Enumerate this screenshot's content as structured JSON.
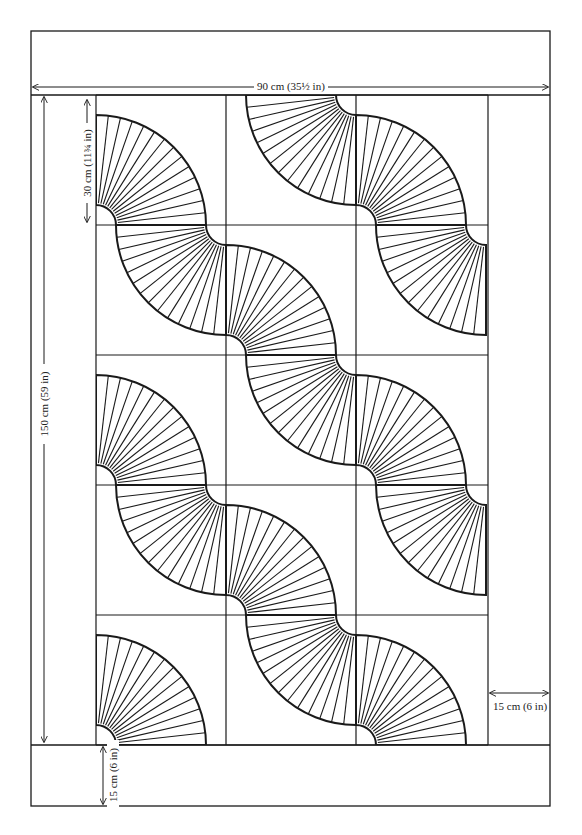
{
  "diagram": {
    "stroke_color": "#1a1a1a",
    "background": "#ffffff",
    "outer_frame": {
      "x": 31,
      "y": 31,
      "w": 519,
      "h": 775
    },
    "inner_panel": {
      "x": 96,
      "y": 95,
      "w": 392,
      "h": 650
    },
    "grid": {
      "columns_x": [
        96,
        226,
        356,
        488
      ],
      "rows_y": [
        95,
        225,
        355,
        485,
        615,
        745
      ]
    },
    "fan": {
      "inner_radius": 20,
      "outer_radius": 110,
      "rays": 14
    },
    "fans": [
      {
        "cx": 96,
        "cy": 225,
        "quadrant": "UR"
      },
      {
        "cx": 226,
        "cy": 225,
        "quadrant": "LL"
      },
      {
        "cx": 226,
        "cy": 355,
        "quadrant": "UR"
      },
      {
        "cx": 356,
        "cy": 355,
        "quadrant": "LL"
      },
      {
        "cx": 356,
        "cy": 485,
        "quadrant": "UR"
      },
      {
        "cx": 486,
        "cy": 485,
        "quadrant": "LL"
      },
      {
        "cx": 356,
        "cy": 95,
        "quadrant": "LL"
      },
      {
        "cx": 356,
        "cy": 225,
        "quadrant": "UR"
      },
      {
        "cx": 486,
        "cy": 225,
        "quadrant": "LL"
      },
      {
        "cx": 96,
        "cy": 485,
        "quadrant": "UR"
      },
      {
        "cx": 226,
        "cy": 485,
        "quadrant": "LL"
      },
      {
        "cx": 226,
        "cy": 615,
        "quadrant": "UR"
      },
      {
        "cx": 356,
        "cy": 615,
        "quadrant": "LL"
      },
      {
        "cx": 356,
        "cy": 745,
        "quadrant": "UR"
      },
      {
        "cx": 96,
        "cy": 745,
        "quadrant": "UR"
      }
    ]
  },
  "dimensions": {
    "width_total": "90 cm (35½ in)",
    "height_total": "150 cm (59 in)",
    "block_size": "30 cm (11¾ in)",
    "side_border": "15 cm (6 in)",
    "bottom_border": "15 cm (6 in)"
  }
}
